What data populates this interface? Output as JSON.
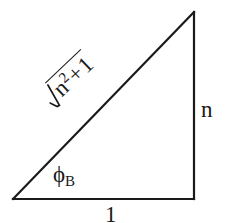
{
  "figure": {
    "kind": "geometry-diagram",
    "background_color": "#ffffff",
    "stroke_color": "#1a1a1a",
    "stroke_width": 2
  },
  "triangle": {
    "vertices": {
      "bottom_left": {
        "x": 13,
        "y": 199
      },
      "bottom_right": {
        "x": 194,
        "y": 199
      },
      "top_right": {
        "x": 194,
        "y": 12
      }
    },
    "sides": [
      {
        "name": "base",
        "from": "bottom_left",
        "to": "bottom_right"
      },
      {
        "name": "vertical-leg",
        "from": "bottom_right",
        "to": "top_right"
      },
      {
        "name": "hypotenuse",
        "from": "bottom_left",
        "to": "top_right"
      }
    ]
  },
  "labels": {
    "vertical_leg": "n",
    "base": "1",
    "angle_symbol": "ϕ",
    "angle_subscript": "B",
    "hypotenuse": {
      "radical_glyph": "√",
      "radicand_base": "n",
      "radicand_exponent": "2",
      "operator": "+",
      "radicand_second_term": "1",
      "full_text": "√(n² + 1)",
      "rotation_degrees": -43.5
    }
  }
}
